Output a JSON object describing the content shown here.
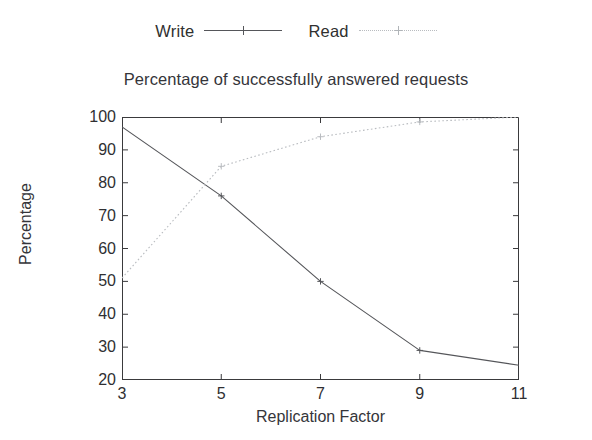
{
  "chart_data": {
    "type": "line",
    "title": "Percentage of successfully answered requests",
    "xlabel": "Replication Factor",
    "ylabel": "Percentage",
    "x": [
      3,
      5,
      7,
      9,
      11
    ],
    "xlim": [
      3,
      11
    ],
    "ylim": [
      20,
      100
    ],
    "xticks": [
      "3",
      "5",
      "7",
      "9",
      "11"
    ],
    "yticks": [
      "20",
      "30",
      "40",
      "50",
      "60",
      "70",
      "80",
      "90",
      "100"
    ],
    "grid": false,
    "legend_position": "top-center",
    "series": [
      {
        "name": "Write",
        "values": [
          97,
          76,
          50,
          29,
          24.5
        ],
        "style": "solid",
        "color": "#55565a",
        "marker": "plus"
      },
      {
        "name": "Read",
        "values": [
          51,
          85,
          94,
          98.5,
          100
        ],
        "style": "dotted",
        "color": "#b9bcc0",
        "marker": "cross"
      }
    ]
  },
  "legend": {
    "entries": [
      {
        "label": "Write"
      },
      {
        "label": "Read"
      }
    ]
  },
  "axes": {
    "y_tick_labels": [
      "100",
      "90",
      "80",
      "70",
      "60",
      "50",
      "40",
      "30",
      "20"
    ],
    "x_tick_labels": [
      "3",
      "5",
      "7",
      "9",
      "11"
    ]
  }
}
